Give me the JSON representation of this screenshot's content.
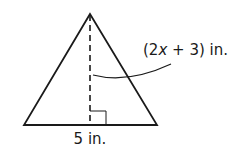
{
  "diagram": {
    "type": "geometry-figure",
    "shape": "triangle",
    "colors": {
      "stroke": "#1a1a1a",
      "background": "#ffffff"
    },
    "triangle": {
      "apex": [
        90,
        14
      ],
      "base_left": [
        24,
        125
      ],
      "base_right": [
        157,
        125
      ]
    },
    "height_line": {
      "style": "dashed",
      "from": [
        90,
        14
      ],
      "to": [
        90,
        125
      ]
    },
    "right_angle_marker": {
      "x": 90,
      "y": 110,
      "size": 16
    },
    "leader_curve": {
      "path": "M 93 75 Q 128 84 171 64"
    },
    "labels": {
      "base": {
        "text": "5 in."
      },
      "height": {
        "prefix": "(2",
        "variable": "x",
        "suffix": " + 3) in."
      }
    }
  }
}
